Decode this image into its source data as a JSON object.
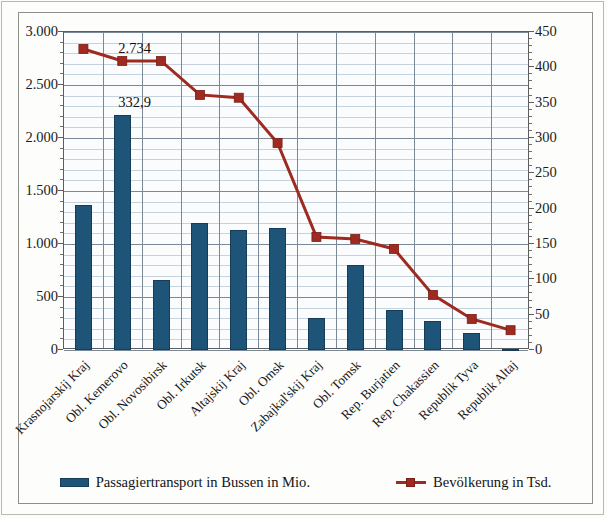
{
  "chart_data": {
    "type": "bar",
    "title": "",
    "subtitle": "",
    "xlabel": "",
    "ylabel": "",
    "categories": [
      "Krasnojarskij Kraj",
      "Obl. Kemerovo",
      "Obl. Novosibirsk",
      "Obl. Irkutsk",
      "Altajskij Kraj",
      "Obl. Omsk",
      "Zabajkal'skij Kraj",
      "Obl. Tomsk",
      "Rep. Burjatien",
      "Rep. Chakassien",
      "Republik Tyva",
      "Republik Altaj"
    ],
    "series": [
      {
        "name": "Passagiertransport in Bussen in Mio.",
        "type": "bar",
        "axis": "left",
        "color": "#1f5479",
        "values": [
          1370,
          2220,
          660,
          1195,
          1130,
          1150,
          300,
          800,
          375,
          275,
          165,
          10
        ]
      },
      {
        "name": "Bevölkerung in Tsd.",
        "type": "line",
        "axis": "right",
        "color": "#9e2a20",
        "marker": "square",
        "values": [
          426,
          409,
          409,
          361,
          357,
          293,
          160,
          157,
          143,
          78,
          44,
          28
        ]
      }
    ],
    "data_labels": [
      {
        "text": "2.734",
        "series": "Bevölkerung in Tsd.",
        "category": "Obl. Kemerovo"
      },
      {
        "text": "332,9",
        "series": "Passagiertransport in Bussen in Mio.",
        "category": "Obl. Kemerovo"
      }
    ],
    "yaxis_left": {
      "min": 0,
      "max": 3000,
      "step": 500,
      "minor_step": 100,
      "ticks": [
        "0",
        "500",
        "1.000",
        "1.500",
        "2.000",
        "2.500",
        "3.000"
      ]
    },
    "yaxis_right": {
      "min": 0,
      "max": 450,
      "step": 50,
      "minor_step": 10,
      "ticks": [
        "0",
        "50",
        "100",
        "150",
        "200",
        "250",
        "300",
        "350",
        "400",
        "450"
      ]
    },
    "grid": true,
    "legend_position": "bottom",
    "legend": [
      {
        "label": "Passagiertransport in Bussen in Mio.",
        "marker": "bar-swatch",
        "color": "#1f5479"
      },
      {
        "label": "Bevölkerung in Tsd.",
        "marker": "line-square",
        "color": "#9e2a20"
      }
    ]
  }
}
